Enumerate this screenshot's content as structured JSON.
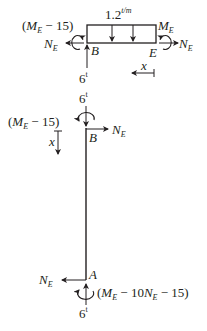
{
  "colors": {
    "stroke": "#231f20",
    "background": "#ffffff"
  },
  "beam_fbd": {
    "load": {
      "value": "1.2",
      "unit": "t/m"
    },
    "left_moment": {
      "open": "(",
      "M": "M",
      "sub": "E",
      "rest": " − 15",
      "close": ")"
    },
    "right_moment": {
      "M": "M",
      "sub": "E"
    },
    "left_axial": {
      "N": "N",
      "sub": "E"
    },
    "right_axial": {
      "N": "N",
      "sub": "E"
    },
    "node_left": "B",
    "node_right": "E",
    "reaction": {
      "value": "6",
      "unit": "t"
    },
    "coordinate": "x"
  },
  "column_fbd": {
    "top_force": {
      "value": "6",
      "unit": "t"
    },
    "top_moment": {
      "open": "(",
      "M": "M",
      "sub": "E",
      "rest": " − 15",
      "close": ")"
    },
    "top_axial": {
      "N": "N",
      "sub": "E"
    },
    "node_top": "B",
    "coordinate": "x",
    "node_bottom": "A",
    "bottom_axial": {
      "N": "N",
      "sub": "E"
    },
    "bottom_moment": {
      "open": "(",
      "M": "M",
      "sub1": "E",
      "mid": " − 10",
      "N": "N",
      "sub2": "E",
      "rest": " − 15",
      "close": ")"
    },
    "bottom_force": {
      "value": "6",
      "unit": "t"
    }
  }
}
